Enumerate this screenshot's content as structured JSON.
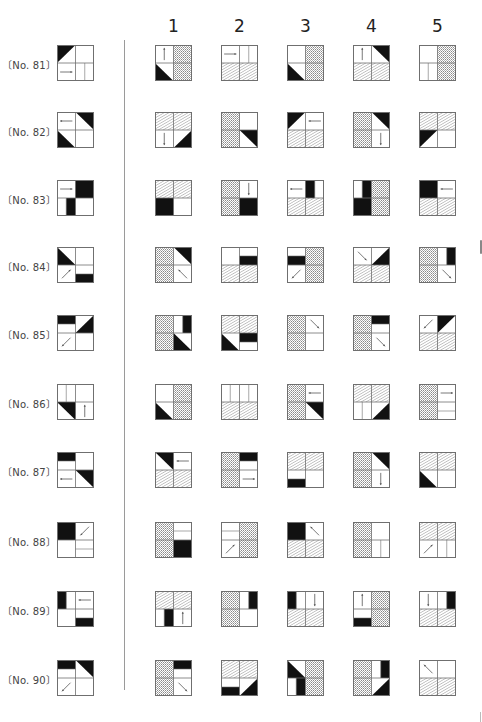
{
  "page": {
    "column_headers": [
      "1",
      "2",
      "3",
      "4",
      "5"
    ],
    "colors": {
      "ink": "#111111",
      "border": "#6f6f6f",
      "hatch": "#8a8a8a"
    }
  },
  "legend_of_cell_codes": {
    "W": "blank",
    "H": "diagonal-hatch",
    "D": "fine-crosshatch",
    "K": "solid-black",
    "triTL": "black triangle upper-left",
    "triBL": "black triangle lower-left",
    "triTR": "black triangle upper-right",
    "triBR": "black triangle lower-right",
    "barT": "black bar top half",
    "barB": "black bar bottom half",
    "barL": "black bar left half",
    "barR": "black bar right half",
    "aR": "arrow right",
    "aL": "arrow left",
    "aU": "arrow up",
    "aD": "arrow down",
    "aDL": "arrow down-left",
    "aDR": "arrow down-right",
    "aUR": "arrow up-right",
    "aUL": "arrow up-left",
    "vl": "vertical split line",
    "hl": "horizontal split line"
  },
  "problems": [
    {
      "label": "〔No. 81〕",
      "question": [
        "triTL",
        "W",
        "aR",
        "vl"
      ],
      "options": [
        [
          "aU",
          "D",
          "triBL",
          "D"
        ],
        [
          "aR",
          "vl",
          "H",
          "H"
        ],
        [
          "W",
          "D",
          "triBL",
          "D"
        ],
        [
          "aU",
          "triTR",
          "H",
          "H"
        ],
        [
          "W",
          "D",
          "vl",
          "D"
        ]
      ]
    },
    {
      "label": "〔No. 82〕",
      "question": [
        "aL",
        "triTR",
        "triBL",
        "W"
      ],
      "options": [
        [
          "H",
          "H",
          "aD",
          "triBR"
        ],
        [
          "D",
          "W",
          "D",
          "triTR"
        ],
        [
          "triTL",
          "aL",
          "H",
          "H"
        ],
        [
          "D",
          "triTR",
          "D",
          "aD"
        ],
        [
          "H",
          "H",
          "triTL",
          "W"
        ]
      ]
    },
    {
      "label": "〔No. 83〕",
      "question": [
        "aR",
        "K",
        "barR",
        "W"
      ],
      "options": [
        [
          "H",
          "H",
          "K",
          "W"
        ],
        [
          "D",
          "aD",
          "D",
          "K"
        ],
        [
          "aL",
          "barL",
          "H",
          "H"
        ],
        [
          "barR",
          "D",
          "K",
          "D"
        ],
        [
          "K",
          "aL",
          "H",
          "H"
        ]
      ]
    },
    {
      "label": "〔No. 84〕",
      "question": [
        "triBL",
        "W",
        "aUR",
        "barB"
      ],
      "options": [
        [
          "D",
          "triTR",
          "D",
          "aUL"
        ],
        [
          "W",
          "barB",
          "H",
          "H"
        ],
        [
          "barB",
          "D",
          "aDL",
          "D"
        ],
        [
          "aDR",
          "triBR",
          "H",
          "H"
        ],
        [
          "D",
          "barR",
          "D",
          "aDR"
        ]
      ]
    },
    {
      "label": "〔No. 85〕",
      "question": [
        "barT",
        "triBR",
        "aDL",
        "W"
      ],
      "options": [
        [
          "D",
          "barR",
          "D",
          "triBL"
        ],
        [
          "H",
          "H",
          "triBL",
          "barT"
        ],
        [
          "D",
          "aDR",
          "D",
          "W"
        ],
        [
          "D",
          "barT",
          "D",
          "aDR"
        ],
        [
          "aDL",
          "triTL",
          "H",
          "H"
        ]
      ]
    },
    {
      "label": "〔No. 86〕",
      "question": [
        "vl",
        "W",
        "triTR",
        "aU"
      ],
      "options": [
        [
          "W",
          "D",
          "triBL",
          "D"
        ],
        [
          "vl",
          "vl",
          "H",
          "H"
        ],
        [
          "D",
          "aL",
          "D",
          "triTR"
        ],
        [
          "H",
          "H",
          "vl",
          "triBR"
        ],
        [
          "D",
          "aR",
          "D",
          "hl"
        ]
      ]
    },
    {
      "label": "〔No. 87〕",
      "question": [
        "barT",
        "W",
        "aL",
        "triTR"
      ],
      "options": [
        [
          "triTR",
          "aL",
          "H",
          "H"
        ],
        [
          "D",
          "barT",
          "D",
          "aR"
        ],
        [
          "H",
          "H",
          "barB",
          "W"
        ],
        [
          "D",
          "triTR",
          "D",
          "aD"
        ],
        [
          "H",
          "H",
          "triBL",
          "W"
        ]
      ]
    },
    {
      "label": "〔No. 88〕",
      "question": [
        "K",
        "aDL",
        "W",
        "hl"
      ],
      "options": [
        [
          "D",
          "hl",
          "D",
          "K"
        ],
        [
          "hl",
          "D",
          "aUR",
          "D"
        ],
        [
          "K",
          "aUL",
          "H",
          "H"
        ],
        [
          "D",
          "W",
          "D",
          "vl"
        ],
        [
          "H",
          "H",
          "aUR",
          "vl"
        ]
      ]
    },
    {
      "label": "〔No. 89〕",
      "question": [
        "barL",
        "aL",
        "W",
        "barB"
      ],
      "options": [
        [
          "H",
          "H",
          "barR",
          "aU"
        ],
        [
          "D",
          "barR",
          "D",
          "W"
        ],
        [
          "barL",
          "aD",
          "H",
          "H"
        ],
        [
          "aU",
          "D",
          "barB",
          "D"
        ],
        [
          "aD",
          "barR",
          "H",
          "H"
        ]
      ]
    },
    {
      "label": "〔No. 90〕",
      "question": [
        "barT",
        "triTR",
        "aDL",
        "W"
      ],
      "options": [
        [
          "D",
          "barT",
          "D",
          "aDR"
        ],
        [
          "H",
          "H",
          "barB",
          "triBR"
        ],
        [
          "triBL",
          "D",
          "barR",
          "D"
        ],
        [
          "D",
          "barR",
          "D",
          "triBR"
        ],
        [
          "aUL",
          "W",
          "H",
          "H"
        ]
      ]
    }
  ]
}
